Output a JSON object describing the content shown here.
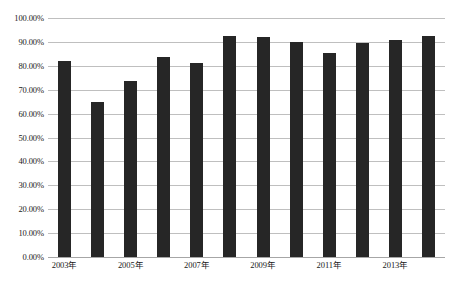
{
  "chart_data": {
    "type": "bar",
    "title": "",
    "subtitle": "",
    "xlabel": "",
    "ylabel": "",
    "categories": [
      "2003年",
      "2004年",
      "2005年",
      "2006年",
      "2007年",
      "2008年",
      "2009年",
      "2010年",
      "2011年",
      "2012年",
      "2013年",
      "2014年"
    ],
    "values": [
      82.0,
      65.0,
      73.5,
      83.5,
      81.0,
      92.5,
      92.0,
      90.0,
      85.5,
      89.5,
      91.0,
      92.5
    ],
    "series": [
      {
        "name": "",
        "values": [
          82.0,
          65.0,
          73.5,
          83.5,
          81.0,
          92.5,
          92.0,
          90.0,
          85.5,
          89.5,
          91.0,
          92.5
        ]
      }
    ],
    "ylim": [
      0,
      100
    ],
    "y_tick_values": [
      0,
      10,
      20,
      30,
      40,
      50,
      60,
      70,
      80,
      90,
      100
    ],
    "y_tick_labels": [
      "0.00%",
      "10.00%",
      "20.00%",
      "30.00%",
      "40.00%",
      "50.00%",
      "60.00%",
      "70.00%",
      "80.00%",
      "90.00%",
      "100.00%"
    ],
    "x_tick_labels": [
      "2003年",
      "",
      "2005年",
      "",
      "2007年",
      "",
      "2009年",
      "",
      "2011年",
      "",
      "2013年",
      ""
    ],
    "x_visible_tick_labels": [
      "2003年",
      "2005年",
      "2007年",
      "2009年",
      "2011年",
      "2013年"
    ],
    "grid": true,
    "grid_axis": "y",
    "legend": false,
    "legend_position": "none",
    "bar_color": "#262626",
    "gridline_color": "#bfbfbf",
    "background_color": "#ffffff",
    "text_color": "#1a1a1a",
    "annotations": []
  }
}
